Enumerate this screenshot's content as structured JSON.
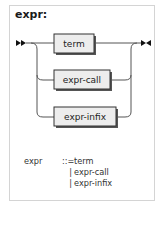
{
  "diagram": {
    "title": "expr:",
    "start_marker": "start-double-arrow",
    "end_marker": "end-arrow-bar",
    "alternatives": [
      {
        "label": "term"
      },
      {
        "label": "expr-call"
      },
      {
        "label": "expr-infix"
      }
    ],
    "colors": {
      "line": "#555555",
      "box_fill": "#ededed",
      "box_border": "#333333",
      "box_shadow": "#555555",
      "frame_border": "#d4d4d4"
    }
  },
  "grammar": {
    "lhs": "expr",
    "operator": "::=",
    "rules": [
      {
        "prefix": "",
        "text": "term"
      },
      {
        "prefix": "|",
        "text": "expr-call"
      },
      {
        "prefix": "|",
        "text": "expr-infix"
      }
    ]
  }
}
